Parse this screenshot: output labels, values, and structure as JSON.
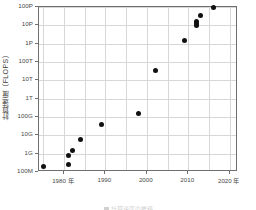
{
  "figure": {
    "caption": "計算速度の推移",
    "caption_marker": "chart-legend-square"
  },
  "chart_data": {
    "type": "scatter",
    "title": "",
    "xlabel": "年",
    "ylabel": "計算速度（FLOPS）",
    "ylabel_unit": "(FLOPS)",
    "ylabel_text": "計算速度",
    "yscale": "log",
    "ylim": [
      100000000,
      100000000000000000
    ],
    "xlim": [
      1974,
      2022
    ],
    "grid": true,
    "legend": "none",
    "y_ticklabels": [
      "100M",
      "1G",
      "10G",
      "100G",
      "1T",
      "10T",
      "100T",
      "1P",
      "10P",
      "100P"
    ],
    "y_tickvalues": [
      100000000,
      1000000000,
      10000000000,
      100000000000,
      1000000000000,
      10000000000000,
      100000000000000,
      1000000000000000,
      10000000000000000,
      100000000000000000
    ],
    "x_ticklabels": [
      "1980 年",
      "1990",
      "2000",
      "2010",
      "2020 年"
    ],
    "x_tickvalues": [
      1980,
      1990,
      2000,
      2010,
      2020
    ],
    "x_minor_tickvalues": [
      1975,
      1985,
      1995,
      2005,
      2015
    ],
    "points": [
      {
        "x": 1975,
        "y": 200000000,
        "y_label": "200M"
      },
      {
        "x": 1981,
        "y": 250000000,
        "y_label": "250M"
      },
      {
        "x": 1981,
        "y": 800000000,
        "y_label": "800M"
      },
      {
        "x": 1982,
        "y": 1500000000,
        "y_label": "1.5G"
      },
      {
        "x": 1984,
        "y": 6000000000,
        "y_label": "6G"
      },
      {
        "x": 1989,
        "y": 40000000000,
        "y_label": "40G"
      },
      {
        "x": 1998,
        "y": 150000000000,
        "y_label": "150G"
      },
      {
        "x": 2002,
        "y": 35000000000000,
        "y_label": "35T"
      },
      {
        "x": 2009,
        "y": 1500000000000000,
        "y_label": "1.5P"
      },
      {
        "x": 2012,
        "y": 10000000000000000,
        "y_label": "10P"
      },
      {
        "x": 2012,
        "y": 13000000000000000,
        "y_label": "13P"
      },
      {
        "x": 2012,
        "y": 17000000000000000,
        "y_label": "17P"
      },
      {
        "x": 2013,
        "y": 34000000000000000,
        "y_label": "34P"
      },
      {
        "x": 2016,
        "y": 93000000000000000,
        "y_label": "93P"
      }
    ]
  }
}
